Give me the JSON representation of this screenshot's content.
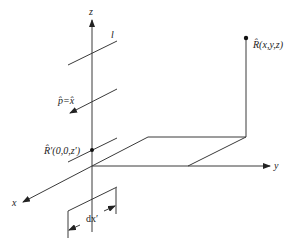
{
  "figure": {
    "colors": {
      "stroke": "#3a3a3a",
      "text": "#222222",
      "background": "#ffffff"
    },
    "axes": {
      "z_label": "z",
      "y_label": "y",
      "x_label": "x"
    },
    "labels": {
      "line_label": "l",
      "polarization": "p̂=x̂",
      "source_point": "R̂′(0,0,z′)",
      "observation_point": "R̂(x,y,z)",
      "differential": "dx′"
    }
  }
}
